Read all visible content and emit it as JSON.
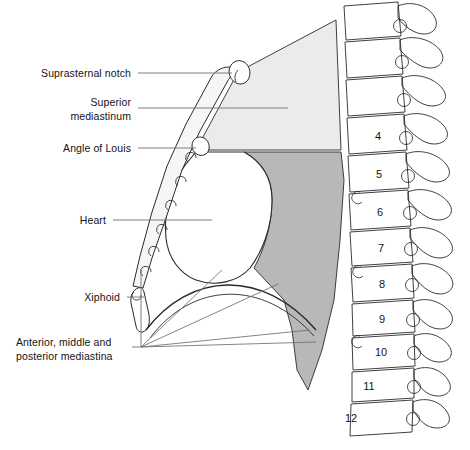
{
  "figure": {
    "colors": {
      "superior_mediastinum_fill": "#ebebeb",
      "posterior_region_fill": "#b8b8b8",
      "outline": "#2a2a2a",
      "leader_line": "#6f6f6f",
      "text": "#141414",
      "background": "#ffffff"
    }
  },
  "labels": [
    {
      "id": "suprasternal-notch",
      "text": "Suprasternal notch",
      "lines": [
        "Suprasternal notch"
      ]
    },
    {
      "id": "superior-mediastinum",
      "text": "Superior mediastinum",
      "lines": [
        "Superior",
        "mediastinum"
      ]
    },
    {
      "id": "angle-of-louis",
      "text": "Angle of Louis",
      "lines": [
        "Angle of Louis"
      ]
    },
    {
      "id": "heart",
      "text": "Heart",
      "lines": [
        "Heart"
      ]
    },
    {
      "id": "xiphoid",
      "text": "Xiphoid",
      "lines": [
        "Xiphoid"
      ]
    },
    {
      "id": "mediastina",
      "text": "Anterior, middle and posterior mediastina",
      "lines": [
        "Anterior, middle and",
        "posterior mediastina"
      ]
    }
  ],
  "label_text": {
    "suprasternal_notch": "Suprasternal notch",
    "superior_line1": "Superior",
    "superior_line2": "mediastinum",
    "angle_of_louis": "Angle of Louis",
    "heart": "Heart",
    "xiphoid": "Xiphoid",
    "mediastina_line1": "Anterior, middle and",
    "mediastina_line2": "posterior mediastina"
  },
  "vertebrae": {
    "label_name": "thoracic vertebrae",
    "numbers": [
      "4",
      "5",
      "6",
      "7",
      "8",
      "9",
      "10",
      "11",
      "12"
    ]
  }
}
